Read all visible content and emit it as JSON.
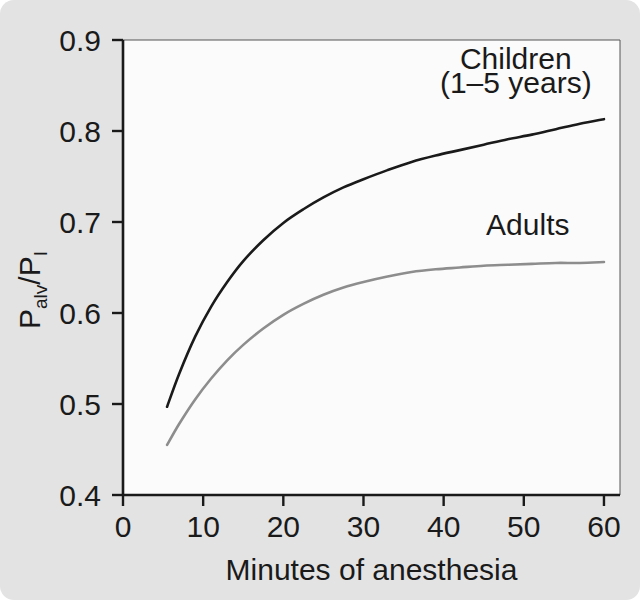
{
  "figure": {
    "background_color": "#e3e3e3",
    "plot_background_color": "#fbfbfb",
    "axis_color": "#1a1a1a"
  },
  "chart_data": {
    "type": "line",
    "title": "",
    "subtitle": "",
    "xlabel": "Minutes of anesthesia",
    "ylabel": "Palv/PI",
    "ylabel_parts": {
      "p1": "P",
      "sub1": "alv",
      "slash": "/",
      "p2": "P",
      "sub2": "I"
    },
    "xlim": [
      0,
      62
    ],
    "ylim": [
      0.4,
      0.9
    ],
    "xticks": [
      0,
      10,
      20,
      30,
      40,
      50,
      60
    ],
    "xtick_labels": [
      "0",
      "10",
      "20",
      "30",
      "40",
      "50",
      "60"
    ],
    "yticks": [
      0.4,
      0.5,
      0.6,
      0.7,
      0.8,
      0.9
    ],
    "ytick_labels": [
      "0.4",
      "0.5",
      "0.6",
      "0.7",
      "0.8",
      "0.9"
    ],
    "grid": false,
    "legend_position": "inline-annotations",
    "series": [
      {
        "name": "Children (1-5 years)",
        "color": "#1a1a1a",
        "line_width": 2.6,
        "annotation_line1": "Children",
        "annotation_line2": "(1–5 years)",
        "x": [
          5.5,
          7,
          9,
          11,
          13,
          15,
          17.5,
          20,
          22.5,
          25,
          27.5,
          30,
          33,
          36,
          39,
          42,
          45,
          48,
          51,
          54,
          57,
          60
        ],
        "y": [
          0.497,
          0.533,
          0.574,
          0.607,
          0.634,
          0.657,
          0.68,
          0.699,
          0.714,
          0.727,
          0.738,
          0.747,
          0.757,
          0.766,
          0.773,
          0.779,
          0.785,
          0.791,
          0.796,
          0.802,
          0.808,
          0.813
        ]
      },
      {
        "name": "Adults",
        "color": "#8d8d8d",
        "line_width": 2.6,
        "annotation_line1": "Adults",
        "annotation_line2": "",
        "x": [
          5.5,
          7,
          9,
          11,
          13,
          15,
          17.5,
          20,
          22.5,
          25,
          27.5,
          30,
          33,
          36,
          39,
          42,
          45,
          48,
          51,
          54,
          57,
          60
        ],
        "y": [
          0.455,
          0.478,
          0.505,
          0.528,
          0.548,
          0.565,
          0.583,
          0.598,
          0.61,
          0.62,
          0.628,
          0.634,
          0.64,
          0.645,
          0.648,
          0.65,
          0.652,
          0.653,
          0.654,
          0.655,
          0.655,
          0.656
        ]
      }
    ],
    "annotations": [
      {
        "text": "Children",
        "x": 49,
        "y": 0.868
      },
      {
        "text": "(1–5 years)",
        "x": 49,
        "y": 0.842
      },
      {
        "text": "Adults",
        "x": 50.5,
        "y": 0.686
      }
    ]
  }
}
